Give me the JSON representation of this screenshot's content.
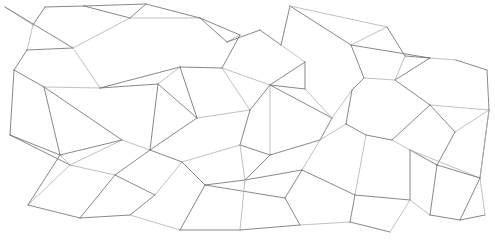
{
  "image": {
    "description": "abstract-line-network-pattern",
    "width": 495,
    "height": 244,
    "background": "#ffffff",
    "line_color": "#6a6a6a",
    "light_line_color": "#b0b0b0"
  },
  "nodes": [
    [
      5,
      7
    ],
    [
      33,
      25
    ],
    [
      45,
      7
    ],
    [
      73,
      48
    ],
    [
      27,
      50
    ],
    [
      14,
      70
    ],
    [
      44,
      87
    ],
    [
      100,
      88
    ],
    [
      130,
      18
    ],
    [
      158,
      84
    ],
    [
      84,
      6
    ],
    [
      146,
      4
    ],
    [
      200,
      18
    ],
    [
      240,
      35
    ],
    [
      180,
      67
    ],
    [
      222,
      68
    ],
    [
      260,
      30
    ],
    [
      281,
      45
    ],
    [
      305,
      62
    ],
    [
      305,
      89
    ],
    [
      227,
      42
    ],
    [
      290,
      6
    ],
    [
      351,
      45
    ],
    [
      364,
      78
    ],
    [
      387,
      27
    ],
    [
      405,
      56
    ],
    [
      430,
      58
    ],
    [
      456,
      60
    ],
    [
      487,
      70
    ],
    [
      489,
      110
    ],
    [
      395,
      80
    ],
    [
      352,
      90
    ],
    [
      332,
      118
    ],
    [
      270,
      85
    ],
    [
      250,
      110
    ],
    [
      197,
      118
    ],
    [
      240,
      145
    ],
    [
      122,
      140
    ],
    [
      70,
      165
    ],
    [
      10,
      135
    ],
    [
      28,
      205
    ],
    [
      80,
      218
    ],
    [
      115,
      175
    ],
    [
      150,
      150
    ],
    [
      182,
      162
    ],
    [
      205,
      185
    ],
    [
      245,
      180
    ],
    [
      270,
      155
    ],
    [
      302,
      170
    ],
    [
      285,
      198
    ],
    [
      346,
      124
    ],
    [
      366,
      135
    ],
    [
      392,
      140
    ],
    [
      410,
      150
    ],
    [
      437,
      165
    ],
    [
      455,
      132
    ],
    [
      480,
      178
    ],
    [
      355,
      195
    ],
    [
      410,
      200
    ],
    [
      430,
      215
    ],
    [
      460,
      220
    ],
    [
      485,
      215
    ],
    [
      180,
      230
    ],
    [
      130,
      215
    ],
    [
      240,
      230
    ],
    [
      300,
      225
    ],
    [
      350,
      222
    ],
    [
      390,
      232
    ],
    [
      60,
      155
    ],
    [
      155,
      195
    ],
    [
      320,
      140
    ],
    [
      430,
      105
    ]
  ],
  "edges": [
    [
      0,
      1
    ],
    [
      0,
      3
    ],
    [
      1,
      2
    ],
    [
      1,
      4
    ],
    [
      2,
      10
    ],
    [
      3,
      4
    ],
    [
      3,
      7
    ],
    [
      4,
      5
    ],
    [
      5,
      6
    ],
    [
      6,
      7
    ],
    [
      6,
      37
    ],
    [
      7,
      9
    ],
    [
      3,
      8
    ],
    [
      8,
      10
    ],
    [
      8,
      11
    ],
    [
      8,
      12
    ],
    [
      10,
      11
    ],
    [
      7,
      14
    ],
    [
      9,
      14
    ],
    [
      14,
      15
    ],
    [
      12,
      13
    ],
    [
      13,
      20
    ],
    [
      20,
      16
    ],
    [
      16,
      17
    ],
    [
      17,
      18
    ],
    [
      18,
      19
    ],
    [
      19,
      33
    ],
    [
      15,
      33
    ],
    [
      14,
      35
    ],
    [
      9,
      35
    ],
    [
      35,
      34
    ],
    [
      34,
      33
    ],
    [
      33,
      32
    ],
    [
      32,
      31
    ],
    [
      31,
      23
    ],
    [
      23,
      22
    ],
    [
      22,
      24
    ],
    [
      24,
      25
    ],
    [
      25,
      26
    ],
    [
      26,
      27
    ],
    [
      27,
      28
    ],
    [
      28,
      29
    ],
    [
      23,
      30
    ],
    [
      30,
      26
    ],
    [
      30,
      71
    ],
    [
      71,
      29
    ],
    [
      21,
      17
    ],
    [
      21,
      22
    ],
    [
      21,
      24
    ],
    [
      12,
      20
    ],
    [
      13,
      15
    ],
    [
      15,
      34
    ],
    [
      34,
      36
    ],
    [
      36,
      47
    ],
    [
      47,
      33
    ],
    [
      47,
      70
    ],
    [
      70,
      32
    ],
    [
      70,
      50
    ],
    [
      50,
      51
    ],
    [
      51,
      52
    ],
    [
      52,
      53
    ],
    [
      53,
      54
    ],
    [
      54,
      55
    ],
    [
      55,
      29
    ],
    [
      55,
      71
    ],
    [
      52,
      71
    ],
    [
      53,
      56
    ],
    [
      56,
      29
    ],
    [
      54,
      56
    ],
    [
      37,
      43
    ],
    [
      43,
      35
    ],
    [
      43,
      44
    ],
    [
      44,
      36
    ],
    [
      44,
      45
    ],
    [
      45,
      46
    ],
    [
      46,
      36
    ],
    [
      46,
      47
    ],
    [
      46,
      48
    ],
    [
      48,
      70
    ],
    [
      48,
      49
    ],
    [
      49,
      45
    ],
    [
      37,
      38
    ],
    [
      38,
      39
    ],
    [
      39,
      5
    ],
    [
      38,
      40
    ],
    [
      40,
      41
    ],
    [
      41,
      42
    ],
    [
      42,
      38
    ],
    [
      42,
      43
    ],
    [
      42,
      69
    ],
    [
      69,
      44
    ],
    [
      69,
      63
    ],
    [
      63,
      41
    ],
    [
      63,
      62
    ],
    [
      62,
      45
    ],
    [
      62,
      64
    ],
    [
      64,
      46
    ],
    [
      64,
      65
    ],
    [
      65,
      49
    ],
    [
      65,
      66
    ],
    [
      66,
      57
    ],
    [
      57,
      48
    ],
    [
      57,
      51
    ],
    [
      57,
      58
    ],
    [
      58,
      53
    ],
    [
      58,
      59
    ],
    [
      59,
      60
    ],
    [
      60,
      61
    ],
    [
      61,
      56
    ],
    [
      59,
      54
    ],
    [
      66,
      67
    ],
    [
      67,
      58
    ],
    [
      68,
      39
    ],
    [
      68,
      37
    ],
    [
      68,
      38
    ],
    [
      6,
      68
    ],
    [
      9,
      43
    ],
    [
      19,
      32
    ],
    [
      31,
      50
    ],
    [
      22,
      26
    ],
    [
      25,
      30
    ],
    [
      11,
      12
    ],
    [
      18,
      33
    ],
    [
      29,
      56
    ],
    [
      60,
      56
    ],
    [
      40,
      68
    ]
  ]
}
